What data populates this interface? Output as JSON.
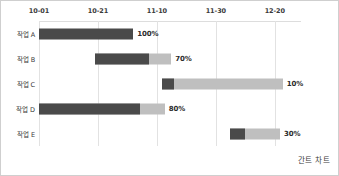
{
  "caption": "간트 차트",
  "chart_data": {
    "type": "bar",
    "chart_kind": "gantt",
    "title": "간트 차트",
    "xlabel": "",
    "ylabel": "",
    "grid": true,
    "legend": "none",
    "axis_ticks": [
      "10-01",
      "10-21",
      "11-10",
      "11-30",
      "12-20"
    ],
    "axis_tick_positions_pct": [
      0,
      22.5,
      45,
      67.5,
      90
    ],
    "categories": [
      "작업 A",
      "작업 B",
      "작업 C",
      "작업 D",
      "작업 E"
    ],
    "series": [
      {
        "name": "progress_percent",
        "values": [
          100,
          70,
          10,
          80,
          30
        ]
      }
    ],
    "tasks": [
      {
        "label": "작업 A",
        "start_tick": "10-01",
        "start_pct": 0,
        "length_pct": 36,
        "progress": 100,
        "progress_label": "100%"
      },
      {
        "label": "작업 B",
        "start_tick": "10-21",
        "start_pct": 21.5,
        "length_pct": 29,
        "progress": 70,
        "progress_label": "70%"
      },
      {
        "label": "작업 C",
        "start_tick": "11-10",
        "start_pct": 47,
        "length_pct": 46,
        "progress": 10,
        "progress_label": "10%"
      },
      {
        "label": "작업 D",
        "start_tick": "10-01",
        "start_pct": 0,
        "length_pct": 48,
        "progress": 80,
        "progress_label": "80%"
      },
      {
        "label": "작업 E",
        "start_tick": "12-20",
        "start_pct": 73,
        "length_pct": 19,
        "progress": 30,
        "progress_label": "30%"
      }
    ],
    "colors": {
      "progress_fill": "#4a4a4a",
      "remaining_fill": "#bfbfbf",
      "gridline": "#e2e2e2",
      "border": "#cfcfcf",
      "text": "#3a3a3a"
    }
  }
}
